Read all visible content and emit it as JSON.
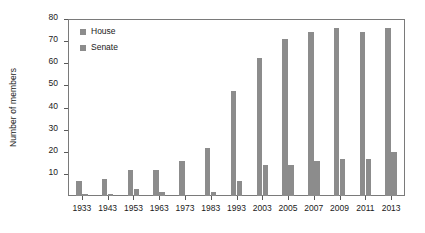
{
  "chart_data": {
    "type": "bar",
    "title": "",
    "xlabel": "",
    "ylabel": "Number of members",
    "ylim": [
      0,
      80
    ],
    "yticks": [
      0,
      10,
      20,
      30,
      40,
      50,
      60,
      70,
      80
    ],
    "ytick_labels": [
      "",
      "10",
      "20",
      "30",
      "40",
      "50",
      "60",
      "70",
      "80"
    ],
    "grid": false,
    "legend_position": "top-left",
    "categories": [
      "1933",
      "1943",
      "1953",
      "1963",
      "1973",
      "1983",
      "1993",
      "2003",
      "2005",
      "2007",
      "2009",
      "2011",
      "2013"
    ],
    "series": [
      {
        "name": "House",
        "color": "#8c8c8c",
        "values": [
          7,
          8,
          12,
          12,
          16,
          22,
          48,
          63,
          72,
          75,
          77,
          75,
          77
        ]
      },
      {
        "name": "Senate",
        "color": "#8c8c8c",
        "values": [
          1,
          1,
          3,
          2,
          0,
          2,
          7,
          14,
          14,
          16,
          17,
          17,
          20
        ]
      }
    ]
  },
  "legend": {
    "items": [
      {
        "label": "House",
        "color": "#8c8c8c"
      },
      {
        "label": "Senate",
        "color": "#8c8c8c"
      }
    ]
  },
  "axes": {
    "y_axis_title": "Number of members"
  }
}
